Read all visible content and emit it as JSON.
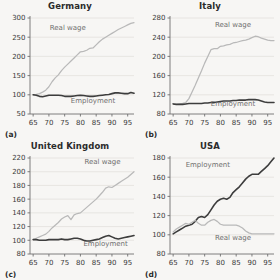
{
  "figure": {
    "background": "#f7f6f4",
    "layout": "2x2 grid of line charts",
    "series_colors": {
      "real_wage": "#b9b9b9",
      "employment": "#3d3d3d"
    },
    "grid_color": "#e3e1dd",
    "axis_color": "#6f6f6f"
  },
  "chart_data": [
    {
      "type": "line",
      "title": "Germany",
      "panel_label": "(a)",
      "xlabel": "",
      "ylabel": "",
      "xlim": [
        64,
        97
      ],
      "ylim": [
        50,
        300
      ],
      "xticks": [
        65,
        70,
        75,
        80,
        85,
        90,
        95
      ],
      "yticks": [
        50,
        100,
        150,
        200,
        250,
        300
      ],
      "grid": true,
      "legend": "inline-annotations",
      "annotations": [
        {
          "text": "Real wage",
          "x": 76,
          "y": 268
        },
        {
          "text": "Employment",
          "x": 84,
          "y": 78
        }
      ],
      "x": [
        65,
        66,
        67,
        68,
        69,
        70,
        71,
        72,
        73,
        74,
        75,
        76,
        77,
        78,
        79,
        80,
        81,
        82,
        83,
        84,
        85,
        86,
        87,
        88,
        89,
        90,
        91,
        92,
        93,
        94,
        95,
        96,
        97
      ],
      "series": [
        {
          "name": "Real wage",
          "values": [
            100,
            101,
            103,
            107,
            112,
            121,
            134,
            144,
            152,
            163,
            172,
            180,
            188,
            196,
            204,
            212,
            213,
            216,
            221,
            222,
            230,
            238,
            245,
            250,
            255,
            260,
            265,
            270,
            274,
            278,
            282,
            286,
            288
          ]
        },
        {
          "name": "Employment",
          "values": [
            100,
            99,
            96,
            95,
            97,
            99,
            99,
            99,
            99,
            98,
            96,
            96,
            96,
            97,
            98,
            99,
            98,
            97,
            96,
            96,
            97,
            98,
            99,
            100,
            101,
            103,
            105,
            105,
            104,
            103,
            103,
            106,
            104
          ]
        }
      ]
    },
    {
      "type": "line",
      "title": "Italy",
      "panel_label": "(b)",
      "xlabel": "",
      "ylabel": "",
      "xlim": [
        64,
        97
      ],
      "ylim": [
        80,
        280
      ],
      "xticks": [
        65,
        70,
        75,
        80,
        85,
        90,
        95
      ],
      "yticks": [
        80,
        120,
        160,
        200,
        240,
        280
      ],
      "grid": true,
      "legend": "inline-annotations",
      "annotations": [
        {
          "text": "Real wage",
          "x": 84,
          "y": 262
        },
        {
          "text": "Employment",
          "x": 84,
          "y": 96
        }
      ],
      "x": [
        65,
        66,
        67,
        68,
        69,
        70,
        71,
        72,
        73,
        74,
        75,
        76,
        77,
        78,
        79,
        80,
        81,
        82,
        83,
        84,
        85,
        86,
        87,
        88,
        89,
        90,
        91,
        92,
        93,
        94,
        95,
        96,
        97
      ],
      "series": [
        {
          "name": "Real wage",
          "values": [
            101,
            100,
            101,
            102,
            104,
            112,
            126,
            140,
            155,
            170,
            186,
            200,
            214,
            216,
            216,
            221,
            222,
            224,
            225,
            228,
            229,
            231,
            233,
            234,
            236,
            239,
            242,
            241,
            238,
            236,
            234,
            233,
            233
          ]
        },
        {
          "name": "Employment",
          "values": [
            101,
            100,
            100,
            100,
            101,
            102,
            102,
            102,
            102,
            102,
            103,
            103,
            104,
            104,
            105,
            106,
            107,
            107,
            107,
            108,
            108,
            109,
            109,
            109,
            110,
            110,
            110,
            109,
            107,
            105,
            104,
            104,
            104
          ]
        }
      ]
    },
    {
      "type": "line",
      "title": "United Kingdom",
      "panel_label": "(c)",
      "xlabel": "",
      "ylabel": "",
      "xlim": [
        64,
        97
      ],
      "ylim": [
        80,
        220
      ],
      "xticks": [
        65,
        70,
        75,
        80,
        85,
        90,
        95
      ],
      "yticks": [
        80,
        100,
        120,
        140,
        160,
        180,
        200,
        220
      ],
      "grid": true,
      "legend": "inline-annotations",
      "annotations": [
        {
          "text": "Real wage",
          "x": 87,
          "y": 211
        },
        {
          "text": "Employment",
          "x": 88,
          "y": 92
        }
      ],
      "x": [
        65,
        66,
        67,
        68,
        69,
        70,
        71,
        72,
        73,
        74,
        75,
        76,
        77,
        78,
        79,
        80,
        81,
        82,
        83,
        84,
        85,
        86,
        87,
        88,
        89,
        90,
        91,
        92,
        93,
        94,
        95,
        96,
        97
      ],
      "series": [
        {
          "name": "Real wage",
          "values": [
            101,
            103,
            105,
            107,
            109,
            113,
            118,
            122,
            126,
            131,
            134,
            136,
            130,
            137,
            139,
            140,
            144,
            148,
            152,
            156,
            160,
            165,
            170,
            176,
            178,
            177,
            180,
            183,
            186,
            189,
            192,
            196,
            200
          ]
        },
        {
          "name": "Employment",
          "values": [
            101,
            101,
            100,
            100,
            100,
            101,
            101,
            101,
            101,
            102,
            101,
            101,
            102,
            103,
            103,
            102,
            100,
            99,
            99,
            100,
            101,
            102,
            104,
            106,
            107,
            105,
            103,
            102,
            103,
            104,
            105,
            106,
            107
          ]
        }
      ]
    },
    {
      "type": "line",
      "title": "USA",
      "panel_label": "(d)",
      "xlabel": "",
      "ylabel": "",
      "xlim": [
        64,
        97
      ],
      "ylim": [
        80,
        180
      ],
      "xticks": [
        65,
        70,
        75,
        80,
        85,
        90,
        95
      ],
      "yticks": [
        80,
        100,
        120,
        140,
        160,
        180
      ],
      "grid": true,
      "legend": "inline-annotations",
      "annotations": [
        {
          "text": "Employment",
          "x": 76,
          "y": 171
        },
        {
          "text": "Real wage",
          "x": 84,
          "y": 95
        }
      ],
      "x": [
        65,
        66,
        67,
        68,
        69,
        70,
        71,
        72,
        73,
        74,
        75,
        76,
        77,
        78,
        79,
        80,
        81,
        82,
        83,
        84,
        85,
        86,
        87,
        88,
        89,
        90,
        91,
        92,
        93,
        94,
        95,
        96,
        97
      ],
      "series": [
        {
          "name": "Employment",
          "values": [
            101,
            103,
            105,
            107,
            109,
            110,
            111,
            114,
            118,
            119,
            118,
            121,
            126,
            131,
            135,
            137,
            138,
            137,
            139,
            144,
            147,
            150,
            154,
            158,
            161,
            163,
            163,
            163,
            166,
            169,
            172,
            176,
            180
          ]
        },
        {
          "name": "Real wage",
          "values": [
            103,
            106,
            108,
            110,
            112,
            111,
            113,
            115,
            112,
            110,
            110,
            113,
            115,
            116,
            114,
            111,
            110,
            110,
            110,
            110,
            110,
            109,
            107,
            104,
            102,
            101,
            101,
            101,
            101,
            101,
            101,
            101,
            101
          ]
        }
      ]
    }
  ]
}
